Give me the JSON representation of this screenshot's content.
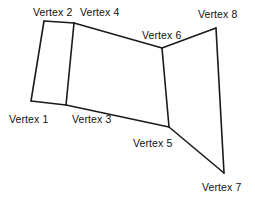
{
  "figure": {
    "type": "line-drawing",
    "width": 255,
    "height": 203,
    "background_color": "#ffffff",
    "stroke_color": "#1a1a1a",
    "stroke_width": 1.6,
    "vertices": [
      {
        "id": 1,
        "label": "Vertex 1",
        "x": 31,
        "y": 101,
        "label_x": 9,
        "label_y": 114
      },
      {
        "id": 2,
        "label": "Vertex 2",
        "x": 44,
        "y": 21,
        "label_x": 33,
        "label_y": 7
      },
      {
        "id": 3,
        "label": "Vertex 3",
        "x": 66,
        "y": 105,
        "label_x": 72,
        "label_y": 114
      },
      {
        "id": 4,
        "label": "Vertex 4",
        "x": 74,
        "y": 23,
        "label_x": 80,
        "label_y": 7
      },
      {
        "id": 5,
        "label": "Vertex 5",
        "x": 169,
        "y": 127,
        "label_x": 133,
        "label_y": 138
      },
      {
        "id": 6,
        "label": "Vertex 6",
        "x": 162,
        "y": 48,
        "label_x": 142,
        "label_y": 30
      },
      {
        "id": 7,
        "label": "Vertex 7",
        "x": 224,
        "y": 173,
        "label_x": 202,
        "label_y": 182
      },
      {
        "id": 8,
        "label": "Vertex 8",
        "x": 216,
        "y": 28,
        "label_x": 198,
        "label_y": 9
      }
    ],
    "edges": [
      {
        "name": "edge-1-2",
        "from": 1,
        "to": 2
      },
      {
        "name": "edge-2-4",
        "from": 2,
        "to": 4
      },
      {
        "name": "edge-4-3",
        "from": 4,
        "to": 3
      },
      {
        "name": "edge-3-1",
        "from": 3,
        "to": 1
      },
      {
        "name": "edge-4-6",
        "from": 4,
        "to": 6
      },
      {
        "name": "edge-6-5",
        "from": 6,
        "to": 5
      },
      {
        "name": "edge-5-3",
        "from": 5,
        "to": 3
      },
      {
        "name": "edge-6-8",
        "from": 6,
        "to": 8
      },
      {
        "name": "edge-8-7",
        "from": 8,
        "to": 7
      },
      {
        "name": "edge-7-5",
        "from": 7,
        "to": 5
      }
    ]
  }
}
